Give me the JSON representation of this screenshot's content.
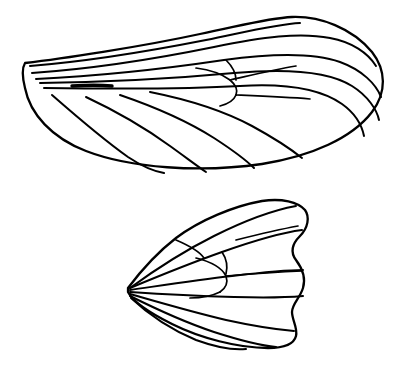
{
  "figure": {
    "background_color": "#ffffff",
    "ink_color": "#000000",
    "style": "black-and-white line drawing",
    "panel_count": 2,
    "caption": ""
  },
  "panels": [
    {
      "id": "forewing",
      "name": "Forewing",
      "label": "",
      "position": "top",
      "bounds": {
        "x": 22,
        "y": 14,
        "width": 366,
        "height": 156
      },
      "description": "Elongate oval forewing, base at left, apex at right, with longitudinal veins and a forked discal cell",
      "vein_count": 14
    },
    {
      "id": "hindwing",
      "name": "Hindwing",
      "label": "",
      "position": "bottom",
      "bounds": {
        "x": 122,
        "y": 198,
        "width": 188,
        "height": 152
      },
      "description": "Broad fan-shaped hindwing with concave outer margin, veins radiating from a single basal point",
      "vein_count": 12
    }
  ],
  "geometry": {
    "forewing": {
      "outline": "M 25 63 C 60 59, 140 47, 200 34 C 240 26, 268 18, 292 17 C 320 16, 352 28, 372 52 C 386 70, 387 92, 372 112 C 352 138, 312 156, 262 164 C 200 173, 130 168, 86 151 C 52 138, 30 114, 25 88 C 22 76, 22 68, 25 63 Z",
      "veins": [
        "M 30 66 C 80 62, 150 51, 206 40 C 250 31, 278 24, 300 23",
        "M 32 73 C 90 69, 160 58, 214 47 C 262 37, 300 32, 330 38 C 352 42, 368 53, 376 66",
        "M 36 79 C 100 76, 170 68, 224 60 C 268 54, 312 52, 340 62 C 362 70, 376 84, 381 97",
        "M 40 83 C 110 82, 180 78, 234 73 C 290 68, 330 72, 352 86 C 368 96, 377 110, 379 120",
        "M 44 88 C 120 89, 190 89, 240 86 C 288 83, 322 90, 342 104 C 356 114, 362 126, 364 136",
        "M 150 92 C 190 100, 226 112, 252 126 C 274 138, 292 150, 302 158",
        "M 120 95 C 158 108, 192 124, 214 138 C 234 151, 248 162, 254 168",
        "M 86 97 C 118 112, 148 130, 170 146 C 188 159, 200 168, 206 172",
        "M 52 95 C 76 116, 104 140, 128 157 C 146 169, 158 172, 164 173"
      ],
      "cell_veins": [
        "M 196 68 C 212 70, 222 74, 230 80 C 236 85, 238 90, 236 95",
        "M 236 95 C 234 100, 228 104, 220 106",
        "M 236 95 C 260 96, 286 97, 310 99",
        "M 230 80 C 248 76, 272 70, 296 66",
        "M 226 60 C 232 66, 236 72, 236 80"
      ],
      "stout_vein": "M 72 86 C 88 85, 100 85, 112 86"
    },
    "hindwing": {
      "outline": "M 128 288 C 140 272, 158 252, 176 238 C 200 220, 234 206, 262 201 C 282 198, 298 202, 305 210 C 310 217, 308 228, 300 236 C 292 244, 290 252, 296 260 C 302 268, 306 278, 303 288 C 300 298, 292 304, 292 312 C 292 320, 298 328, 296 336 C 294 344, 284 348, 268 348 C 238 348, 200 338, 172 324 C 148 312, 132 300, 128 292 Z",
      "veins": [
        "M 130 288 C 152 272, 182 252, 214 236 C 244 221, 274 210, 296 206",
        "M 130 288 C 154 278, 188 264, 222 252 C 256 240, 286 232, 302 230",
        "M 130 290 C 158 286, 196 280, 232 276 C 266 272, 290 270, 303 270",
        "M 130 292 C 160 294, 198 296, 234 297 C 268 298, 292 297, 303 296",
        "M 130 294 C 158 302, 192 312, 226 320 C 258 327, 282 330, 294 331",
        "M 130 296 C 154 308, 184 322, 214 332 C 242 341, 264 346, 276 347",
        "M 131 298 C 148 314, 172 330, 196 340 C 218 348, 236 350, 246 349"
      ],
      "cell_veins": [
        "M 196 258 C 212 262, 222 268, 226 276 C 228 282, 226 288, 220 292",
        "M 220 292 C 212 296, 200 298, 190 298",
        "M 226 276 C 250 274, 278 272, 302 271",
        "M 222 252 C 226 258, 228 266, 226 274",
        "M 176 240 C 190 246, 200 252, 204 258",
        "M 236 240 C 252 236, 276 230, 298 226"
      ]
    }
  }
}
